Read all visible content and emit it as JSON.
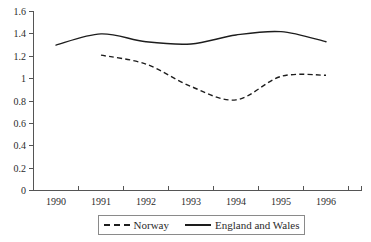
{
  "chart_data": {
    "type": "line",
    "title": "",
    "subtitle": "",
    "xlabel": "",
    "ylabel": "",
    "xlim": [
      1990,
      1996.5
    ],
    "ylim": [
      0,
      1.6
    ],
    "grid": false,
    "legend_position": "bottom",
    "x_tick_labels": [
      "1990",
      "1991",
      "1992",
      "1993",
      "1994",
      "1995",
      "1996"
    ],
    "y_tick_labels": [
      "0",
      "0.2",
      "0.4",
      "0.6",
      "0.8",
      "1",
      "1.2",
      "1.4",
      "1.6"
    ],
    "y_tick_values": [
      0,
      0.2,
      0.4,
      0.6,
      0.8,
      1.0,
      1.2,
      1.4,
      1.6
    ],
    "x": [
      1990,
      1991,
      1992,
      1993,
      1994,
      1995,
      1996
    ],
    "series": [
      {
        "name": "Norway",
        "style": "dashed",
        "color": "#1d1d1d",
        "x": [
          1991,
          1992,
          1993,
          1994,
          1995,
          1996
        ],
        "values": [
          1.21,
          1.13,
          0.93,
          0.81,
          1.02,
          1.03
        ]
      },
      {
        "name": "England and Wales",
        "style": "solid",
        "color": "#1d1d1d",
        "x": [
          1990,
          1991,
          1992,
          1993,
          1994,
          1995,
          1996
        ],
        "values": [
          1.3,
          1.4,
          1.33,
          1.31,
          1.39,
          1.42,
          1.33
        ]
      }
    ]
  },
  "axis": {
    "y_labels": [
      "1.6",
      "1.4",
      "1.2",
      "1",
      "0.8",
      "0.6",
      "0.4",
      "0.2",
      "0"
    ],
    "x_labels": [
      "1990",
      "1991",
      "1992",
      "1993",
      "1994",
      "1995",
      "1996"
    ]
  },
  "legend": {
    "entries": [
      {
        "label": "Norway",
        "style": "dashed"
      },
      {
        "label": "England and Wales",
        "style": "solid"
      }
    ]
  },
  "colors": {
    "line": "#1d1d1d",
    "axis": "#555555",
    "text": "#2b2b2b",
    "legend_border": "#8a8a8a",
    "background": "#ffffff"
  }
}
